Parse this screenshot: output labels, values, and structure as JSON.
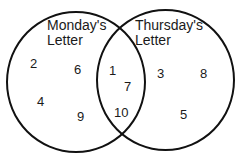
{
  "diagram": {
    "type": "venn",
    "sets": [
      {
        "name": "left",
        "label_line1": "Monday's",
        "label_line2": "Letter",
        "only": [
          "2",
          "6",
          "4",
          "9"
        ]
      },
      {
        "name": "right",
        "label_line1": "Thursday's",
        "label_line2": "Letter",
        "only": [
          "3",
          "8",
          "5"
        ]
      }
    ],
    "intersection": [
      "1",
      "7",
      "10"
    ],
    "colors": {
      "stroke": "#111111",
      "text": "#1a1a1a",
      "background": "#ffffff"
    }
  }
}
